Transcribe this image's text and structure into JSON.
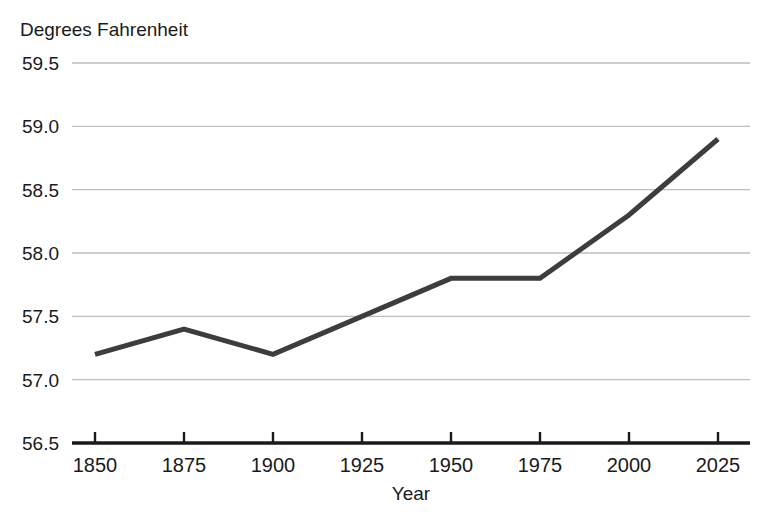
{
  "chart_data": {
    "type": "line",
    "title": "Degrees Fahrenheit",
    "xlabel": "Year",
    "ylabel": "",
    "x": [
      1850,
      1875,
      1900,
      1925,
      1950,
      1975,
      2000,
      2025
    ],
    "values": [
      57.2,
      57.4,
      57.2,
      57.5,
      57.8,
      57.8,
      58.3,
      58.9
    ],
    "series": [
      {
        "name": "Global average temperature",
        "values": [
          57.2,
          57.4,
          57.2,
          57.5,
          57.8,
          57.8,
          58.3,
          58.9
        ]
      }
    ],
    "xtick_labels": [
      "1850",
      "1875",
      "1900",
      "1925",
      "1950",
      "1975",
      "2000",
      "2025"
    ],
    "ytick_labels": [
      "56.5",
      "57.0",
      "57.5",
      "58.0",
      "58.5",
      "59.0",
      "59.5"
    ],
    "ytick_values": [
      56.5,
      57.0,
      57.5,
      58.0,
      58.5,
      59.0,
      59.5
    ],
    "xlim": [
      1842,
      2034
    ],
    "ylim": [
      56.5,
      59.5
    ],
    "grid": true,
    "legend": "none",
    "line_color": "#3d3d3d",
    "grid_color": "#bdbdbd",
    "axis_color": "#1a1a1a",
    "line_width": 5
  },
  "labels": {
    "title": "Degrees Fahrenheit",
    "x_axis_title": "Year"
  }
}
